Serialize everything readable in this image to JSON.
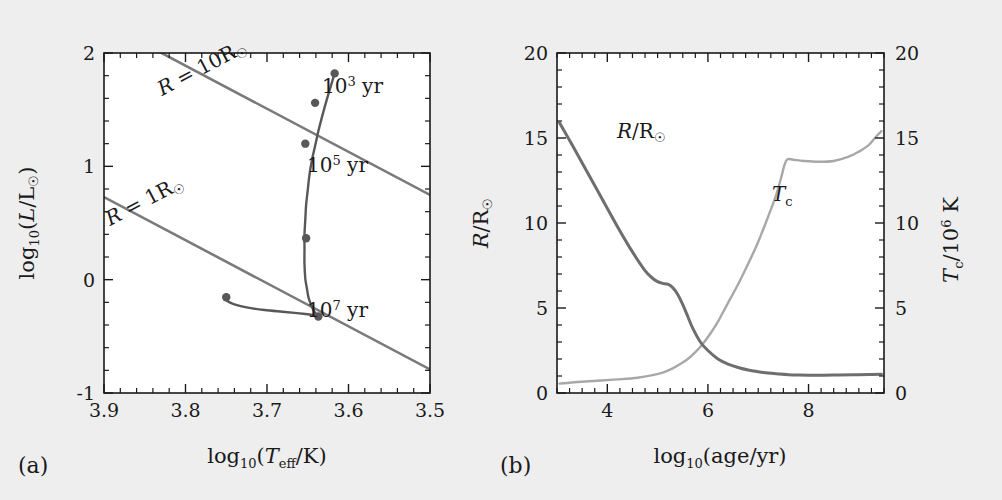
{
  "figure": {
    "background_color": "#eeeeee",
    "panel_background": "#ffffff",
    "panel_a_tag": "(a)",
    "panel_b_tag": "(b)"
  },
  "chart_data": [
    {
      "id": "panel-a",
      "type": "line",
      "title": "",
      "panel_label": "(a)",
      "xlabel": "log₁₀(T_eff/K)",
      "ylabel": "log₁₀(L/L☉)",
      "xlim": [
        3.9,
        3.5
      ],
      "ylim": [
        -1,
        2
      ],
      "x_inverted": true,
      "grid": false,
      "xticks": [
        3.9,
        3.8,
        3.7,
        3.6,
        3.5
      ],
      "xticklabels": [
        "3.9",
        "3.8",
        "3.7",
        "3.6",
        "3.5"
      ],
      "yticks": [
        -1,
        0,
        1,
        2
      ],
      "yticklabels": [
        "-1",
        "0",
        "1",
        "2"
      ],
      "x_minor_step": 0.02,
      "y_minor_step": 0.2,
      "series": [
        {
          "name": "pre-main-sequence evolutionary track",
          "color": "#58585a",
          "x": [
            3.617,
            3.622,
            3.627,
            3.632,
            3.637,
            3.641,
            3.645,
            3.648,
            3.65,
            3.652,
            3.653,
            3.654,
            3.654,
            3.654,
            3.653,
            3.651,
            3.649,
            3.646,
            3.643,
            3.64,
            3.638,
            3.637,
            3.637,
            3.639,
            3.643,
            3.65,
            3.663,
            3.681,
            3.703,
            3.725,
            3.74,
            3.747,
            3.75,
            3.751,
            3.75,
            3.748,
            3.747,
            3.748,
            3.75
          ],
          "y": [
            1.82,
            1.7,
            1.58,
            1.45,
            1.31,
            1.18,
            1.05,
            0.92,
            0.79,
            0.66,
            0.53,
            0.4,
            0.27,
            0.14,
            0.01,
            -0.08,
            -0.16,
            -0.22,
            -0.27,
            -0.3,
            -0.32,
            -0.325,
            -0.322,
            -0.318,
            -0.312,
            -0.305,
            -0.295,
            -0.283,
            -0.268,
            -0.245,
            -0.218,
            -0.196,
            -0.18,
            -0.168,
            -0.16,
            -0.155,
            -0.15,
            -0.14,
            -0.132
          ]
        }
      ],
      "markers": [
        {
          "x": 3.617,
          "y": 1.82,
          "label": "10^3 yr"
        },
        {
          "x": 3.641,
          "y": 1.56,
          "label": ""
        },
        {
          "x": 3.653,
          "y": 1.2,
          "label": "10^5 yr"
        },
        {
          "x": 3.652,
          "y": 0.365,
          "label": ""
        },
        {
          "x": 3.637,
          "y": -0.325,
          "label": "10^7 yr"
        },
        {
          "x": 3.75,
          "y": -0.155,
          "label": ""
        }
      ],
      "annotations": [
        {
          "text": "10³ yr",
          "x": 3.608,
          "y": 1.82
        },
        {
          "text": "10⁵ yr",
          "x": 3.645,
          "y": 1.17
        },
        {
          "text": "10⁷ yr",
          "x": 3.629,
          "y": -0.345
        },
        {
          "text": "R = 10R☉",
          "x": 3.795,
          "y": 1.82,
          "rotation": -25
        },
        {
          "text": "R = 1R☉",
          "x": 3.862,
          "y": 0.4,
          "rotation": -25
        }
      ],
      "reference_lines": [
        {
          "label": "R = 10R☉",
          "x": [
            3.9,
            3.5
          ],
          "y": [
            2.3,
            0.62
          ],
          "color": "#7a7a7c"
        },
        {
          "label": "R = 1R☉",
          "x": [
            3.9,
            3.5
          ],
          "y": [
            0.6,
            -1.08
          ],
          "color": "#7a7a7c"
        }
      ]
    },
    {
      "id": "panel-b",
      "type": "line",
      "title": "",
      "panel_label": "(b)",
      "xlabel": "log₁₀(age/yr)",
      "ylabel": "R/R☉",
      "ylabel_right": "T_c/10⁶ K",
      "xlim": [
        3.0,
        9.5
      ],
      "ylim": [
        0,
        20
      ],
      "ylim_right": [
        0,
        20
      ],
      "grid": false,
      "xticks": [
        4,
        6,
        8
      ],
      "xticklabels": [
        "4",
        "6",
        "8"
      ],
      "yticks": [
        0,
        5,
        10,
        15,
        20
      ],
      "yticklabels": [
        "0",
        "5",
        "10",
        "15",
        "20"
      ],
      "yticks_right": [
        0,
        5,
        10,
        15,
        20
      ],
      "yticklabels_right": [
        "0",
        "5",
        "10",
        "15",
        "20"
      ],
      "x_minor_step": 0.25,
      "y_minor_step": 1,
      "series": [
        {
          "name": "R/R☉",
          "color": "#6e6e70",
          "axis": "left",
          "x": [
            3.05,
            3.3,
            3.6,
            3.9,
            4.2,
            4.5,
            4.75,
            4.9,
            5.0,
            5.1,
            5.2,
            5.3,
            5.4,
            5.5,
            5.6,
            5.7,
            5.85,
            6.0,
            6.2,
            6.4,
            6.6,
            6.8,
            7.0,
            7.2,
            7.4,
            7.6,
            7.8,
            8.0,
            8.3,
            8.6,
            8.9,
            9.2,
            9.45
          ],
          "y": [
            15.9,
            14.6,
            13.0,
            11.4,
            9.8,
            8.3,
            7.2,
            6.75,
            6.55,
            6.45,
            6.4,
            6.2,
            5.8,
            5.2,
            4.5,
            3.8,
            3.0,
            2.5,
            2.0,
            1.7,
            1.5,
            1.35,
            1.25,
            1.17,
            1.12,
            1.08,
            1.06,
            1.05,
            1.05,
            1.06,
            1.07,
            1.09,
            1.1
          ]
        },
        {
          "name": "T_c",
          "color": "#a8a8aa",
          "axis": "right",
          "x": [
            3.05,
            3.4,
            3.8,
            4.2,
            4.6,
            4.9,
            5.1,
            5.3,
            5.45,
            5.6,
            5.75,
            5.9,
            6.05,
            6.2,
            6.4,
            6.6,
            6.8,
            7.0,
            7.2,
            7.35,
            7.45,
            7.52,
            7.58,
            7.7,
            7.9,
            8.2,
            8.5,
            8.8,
            9.0,
            9.2,
            9.35,
            9.45
          ],
          "y": [
            0.55,
            0.65,
            0.72,
            0.8,
            0.9,
            1.05,
            1.2,
            1.45,
            1.7,
            2.0,
            2.4,
            2.9,
            3.5,
            4.2,
            5.3,
            6.4,
            7.6,
            8.9,
            10.4,
            11.6,
            12.6,
            13.4,
            13.75,
            13.72,
            13.65,
            13.6,
            13.65,
            13.9,
            14.2,
            14.6,
            15.1,
            15.4
          ]
        }
      ],
      "annotations": [
        {
          "text": "R/R☉",
          "x": 3.85,
          "y": 15.2
        },
        {
          "text": "T_c",
          "x": 7.1,
          "y": 8.4
        }
      ]
    }
  ]
}
